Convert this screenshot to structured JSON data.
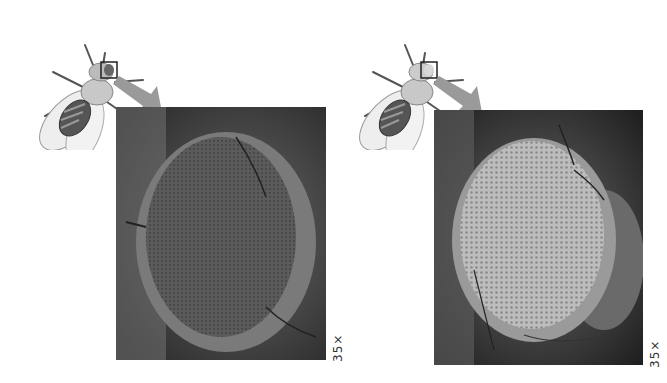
{
  "figure": {
    "panels": [
      {
        "id": "left",
        "fly_illustration": "drosophila-dorsal-view",
        "highlight": "eye-box",
        "photo": "compound-eye-dark",
        "magnification_label": "35×",
        "eye_tone": "#5a5a5a"
      },
      {
        "id": "right",
        "fly_illustration": "drosophila-dorsal-view",
        "highlight": "eye-box",
        "photo": "compound-eye-light",
        "magnification_label": "35×",
        "eye_tone": "#b8b8b8"
      }
    ],
    "colors": {
      "background": "#ffffff",
      "arrow": "#9a9a9a",
      "photo_bg": "#1e1e1e"
    }
  }
}
